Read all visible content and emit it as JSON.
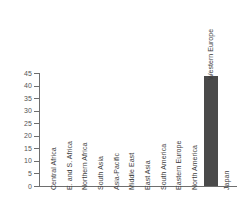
{
  "chart_data": {
    "type": "bar",
    "title": "",
    "subtitle": "",
    "xlabel": "",
    "ylabel": "",
    "categories": [
      "Central Africa",
      "E. and S. Africa",
      "Northern Africa",
      "South Asia",
      "Asia-Pacific",
      "Middle East",
      "East Asia",
      "South America",
      "Eastern Europe",
      "North America",
      "Western Europe",
      "Japan"
    ],
    "values": [
      0,
      0,
      0,
      0,
      0,
      0,
      0,
      0,
      0,
      0,
      44,
      0
    ],
    "ylim": [
      0,
      45
    ],
    "yticks": [
      0,
      5,
      10,
      15,
      20,
      25,
      30,
      35,
      40,
      45
    ],
    "ytick_labels": [
      "0",
      "5",
      "10",
      "15",
      "20",
      "25",
      "30",
      "35",
      "40",
      "45"
    ],
    "grid": false,
    "legend": false,
    "legend_position": "none",
    "bar_color": "#4a4a4a",
    "axis_color": "#6e6e6e",
    "label_color": "#3d3d3d",
    "background_color": "#ffffff",
    "annotations": []
  }
}
